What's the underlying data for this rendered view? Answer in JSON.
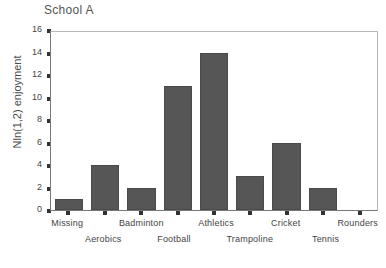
{
  "chart_data": {
    "type": "bar",
    "title": "School A",
    "xlabel": "",
    "ylabel": "Nln(1,2) enjoyment",
    "categories": [
      "Missing",
      "Aerobics",
      "Badminton",
      "Football",
      "Athletics",
      "Trampoline",
      "Cricket",
      "Tennis",
      "Rounders"
    ],
    "values": [
      1,
      4,
      2,
      11,
      14,
      3,
      6,
      2,
      0
    ],
    "ylim": [
      0,
      16
    ],
    "yticks": [
      0,
      2,
      4,
      6,
      8,
      10,
      12,
      14,
      16
    ],
    "ytick_labels": [
      "0",
      "2",
      "4",
      "6",
      "8",
      "10",
      "12",
      "14",
      "16"
    ],
    "grid": false,
    "legend": false,
    "bar_color": "#565656",
    "bar_edge_color": "#4a4a4a",
    "axis_color": "#777777",
    "frame_color": "#b9b9b9",
    "text_color": "#444444",
    "title_color": "#555555",
    "xlabel_rows": {
      "top": [
        "Missing",
        "",
        "Badminton",
        "",
        "Athletics",
        "",
        "Cricket",
        "",
        "Rounders"
      ],
      "bottom": [
        "",
        "Aerobics",
        "",
        "Football",
        "",
        "Trampoline",
        "",
        "Tennis",
        ""
      ]
    }
  }
}
